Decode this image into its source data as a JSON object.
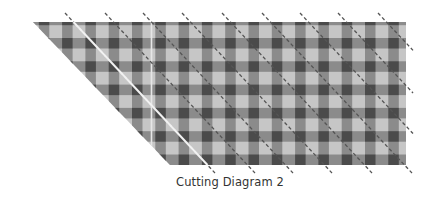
{
  "caption": "Cutting Diagram 2",
  "fabric": {
    "shape": "parallelogram",
    "polygon": [
      [
        33,
        22
      ],
      [
        406,
        22
      ],
      [
        406,
        165
      ],
      [
        170,
        165
      ]
    ],
    "pattern": "gingham",
    "period": 23.3,
    "stripe_width": 10.5,
    "column_offset": 38.8,
    "row_offset": 38,
    "colors": {
      "dark": "#4b4b4b",
      "medium": "#8b8b8b",
      "light": "#c6c6c6"
    },
    "vertical_seam_x": 151.5,
    "vertical_seam_color": "#e6e6e6"
  },
  "cut_lines": {
    "top_y": 13,
    "bottom_y": 173,
    "dx_per_line": 150,
    "right_limit_x": 413,
    "dash_color": "#555555",
    "solid_color": "#f2f2f2",
    "top_x": [
      65,
      105,
      143,
      182,
      222,
      262,
      300,
      338,
      378
    ],
    "solid_index": 0
  }
}
